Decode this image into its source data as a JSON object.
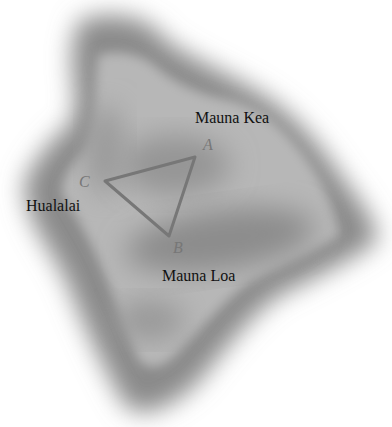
{
  "map": {
    "title": "Island of Hawaii",
    "labels": {
      "mauna_kea": "Mauna Kea",
      "hualalai": "Hualalai",
      "mauna_loa": "Mauna Loa"
    },
    "points": {
      "a": "A",
      "b": "B",
      "c": "C"
    },
    "colors": {
      "land": "#b4b4b4",
      "shade": "#8e8e8e",
      "triangle": "#777777",
      "text": "#111111"
    }
  }
}
